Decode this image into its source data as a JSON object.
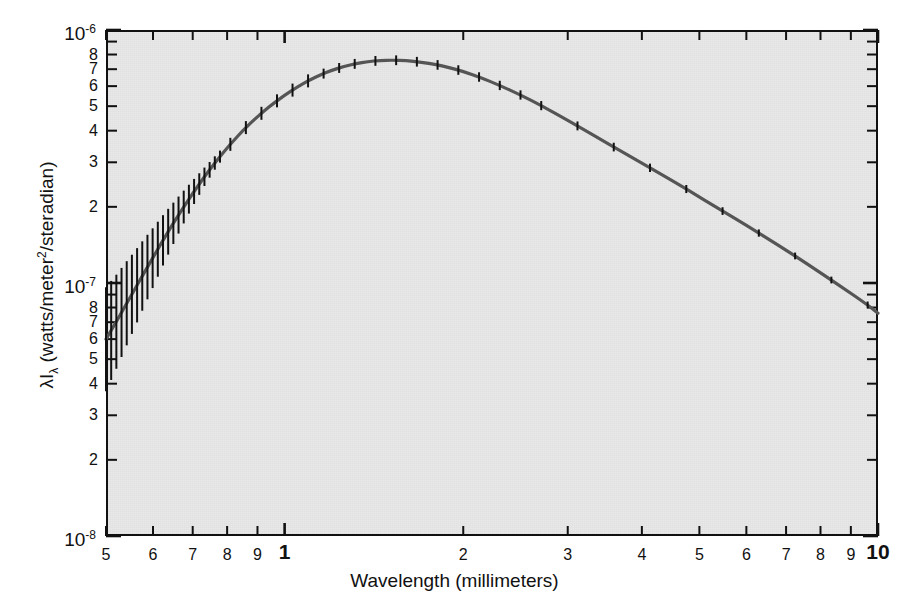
{
  "figure": {
    "background_color": "#ffffff",
    "plot_background_color": "#e9e9e9",
    "curve_color": "#555555",
    "axis_color": "#111111"
  },
  "axes": {
    "x_title": "Wavelength (millimeters)",
    "y_title_main": "I",
    "y_title_lambda": "λ",
    "y_title_sub": "λ",
    "y_title_rest": " (watts/meter",
    "y_title_sup": "2",
    "y_title_tail": "/steradian)",
    "y_title_plain": "λIλ (watts/meter2/steradian)",
    "x_scale": "log",
    "y_scale": "log",
    "x_range": [
      0.5,
      10
    ],
    "y_range": [
      1e-08,
      1e-06
    ],
    "x_unit": "millimeters",
    "y_unit": "watts/meter^2/steradian"
  },
  "x_ticks": [
    {
      "value": 0.5,
      "label": "5",
      "major": false
    },
    {
      "value": 0.6,
      "label": "6",
      "major": false
    },
    {
      "value": 0.7,
      "label": "7",
      "major": false
    },
    {
      "value": 0.8,
      "label": "8",
      "major": false
    },
    {
      "value": 0.9,
      "label": "9",
      "major": false
    },
    {
      "value": 1,
      "label": "1",
      "major": true
    },
    {
      "value": 2,
      "label": "2",
      "major": false
    },
    {
      "value": 3,
      "label": "3",
      "major": false
    },
    {
      "value": 4,
      "label": "4",
      "major": false
    },
    {
      "value": 5,
      "label": "5",
      "major": false
    },
    {
      "value": 6,
      "label": "6",
      "major": false
    },
    {
      "value": 7,
      "label": "7",
      "major": false
    },
    {
      "value": 8,
      "label": "8",
      "major": false
    },
    {
      "value": 9,
      "label": "9",
      "major": false
    },
    {
      "value": 10,
      "label": "10",
      "major": true
    }
  ],
  "y_ticks": [
    {
      "value": 1e-06,
      "label": "10",
      "exponent": "-6",
      "power": true
    },
    {
      "value": 9e-07,
      "label": "",
      "power": false
    },
    {
      "value": 8e-07,
      "label": "8",
      "power": false
    },
    {
      "value": 7e-07,
      "label": "7",
      "power": false
    },
    {
      "value": 6e-07,
      "label": "6",
      "power": false
    },
    {
      "value": 5e-07,
      "label": "5",
      "power": false
    },
    {
      "value": 4e-07,
      "label": "4",
      "power": false
    },
    {
      "value": 3e-07,
      "label": "3",
      "power": false
    },
    {
      "value": 2e-07,
      "label": "2",
      "power": false
    },
    {
      "value": 1e-07,
      "label": "10",
      "exponent": "-7",
      "power": true
    },
    {
      "value": 9e-08,
      "label": "",
      "power": false
    },
    {
      "value": 8e-08,
      "label": "8",
      "power": false
    },
    {
      "value": 7e-08,
      "label": "7",
      "power": false
    },
    {
      "value": 6e-08,
      "label": "6",
      "power": false
    },
    {
      "value": 5e-08,
      "label": "5",
      "power": false
    },
    {
      "value": 4e-08,
      "label": "4",
      "power": false
    },
    {
      "value": 3e-08,
      "label": "3",
      "power": false
    },
    {
      "value": 2e-08,
      "label": "2",
      "power": false
    },
    {
      "value": 1e-08,
      "label": "10",
      "exponent": "-8",
      "power": true
    }
  ],
  "chart_data": {
    "type": "line",
    "title": "",
    "subtitle": "",
    "xlabel": "Wavelength (millimeters)",
    "ylabel": "λIλ (watts/meter2/steradian)",
    "xscale": "log",
    "yscale": "log",
    "xlim": [
      0.5,
      10
    ],
    "ylim": [
      1e-08,
      1e-06
    ],
    "grid": false,
    "legend": "none",
    "series": [
      {
        "name": "Cosmic microwave background blackbody spectrum",
        "x_unit": "mm",
        "y_unit": "W/m^2/sr",
        "x": [
          0.5,
          0.52,
          0.54,
          0.56,
          0.58,
          0.6,
          0.62,
          0.64,
          0.66,
          0.68,
          0.7,
          0.73,
          0.76,
          0.79,
          0.82,
          0.85,
          0.88,
          0.92,
          0.96,
          1.0,
          1.05,
          1.1,
          1.15,
          1.2,
          1.26,
          1.32,
          1.38,
          1.45,
          1.52,
          1.6,
          1.7,
          1.8,
          1.9,
          2.0,
          2.15,
          2.3,
          2.5,
          2.7,
          2.9,
          3.2,
          3.5,
          3.9,
          4.3,
          4.8,
          5.4,
          6.0,
          6.8,
          7.6,
          8.6,
          9.6,
          10.0
        ],
        "y": [
          6e-08,
          7e-08,
          8.2e-08,
          9.5e-08,
          1.1e-07,
          1.26e-07,
          1.44e-07,
          1.63e-07,
          1.83e-07,
          2.04e-07,
          2.26e-07,
          2.6e-07,
          2.95e-07,
          3.3e-07,
          3.65e-07,
          4e-07,
          4.33e-07,
          4.75e-07,
          5.15e-07,
          5.52e-07,
          5.95e-07,
          6.33e-07,
          6.65e-07,
          6.93e-07,
          7.18e-07,
          7.37e-07,
          7.5e-07,
          7.58e-07,
          7.6e-07,
          7.57e-07,
          7.46e-07,
          7.3e-07,
          7.09e-07,
          6.86e-07,
          6.46e-07,
          6.05e-07,
          5.53e-07,
          5.04e-07,
          4.6e-07,
          4.03e-07,
          3.56e-07,
          3.08e-07,
          2.7e-07,
          2.32e-07,
          1.96e-07,
          1.69e-07,
          1.41e-07,
          1.19e-07,
          9.8e-08,
          8.2e-08,
          7.6e-08
        ],
        "has_error_bars": true,
        "error_bar_note": "vertical error bars plotted at each data point; largest at shortest wavelengths"
      }
    ],
    "peak": {
      "x": 1.43,
      "y": 7.6e-07,
      "note": "spectral peak"
    }
  }
}
